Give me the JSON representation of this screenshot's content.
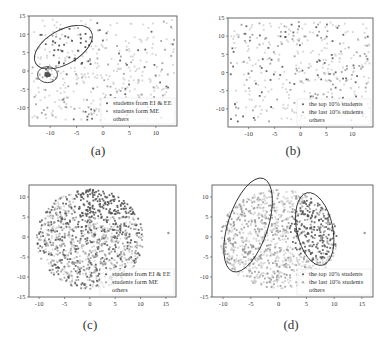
{
  "figure": {
    "panels": [
      {
        "id": "a",
        "caption": "(a)"
      },
      {
        "id": "b",
        "caption": "(b)"
      },
      {
        "id": "c",
        "caption": "(c)"
      },
      {
        "id": "d",
        "caption": "(d)"
      }
    ]
  },
  "chart_data": [
    {
      "panel": "(a)",
      "type": "scatter",
      "title": "",
      "xlabel": "",
      "ylabel": "",
      "xlim": [
        -14,
        14
      ],
      "ylim": [
        -15,
        15
      ],
      "xticks": [
        -10,
        -5,
        0,
        5,
        10
      ],
      "yticks": [
        -10,
        -5,
        0,
        5,
        10,
        15
      ],
      "grid": false,
      "legend_position": "lower right",
      "series": [
        {
          "name": "students from EI & EE",
          "color": "#555555",
          "marker": "dot",
          "note": "sparse dark points concentrated upper-left"
        },
        {
          "name": "students form ME",
          "color": "#9a9a9a",
          "marker": "dot",
          "note": "dense cluster near (-10, -1)"
        },
        {
          "name": "others",
          "color": "#d0d0d0",
          "marker": "dot",
          "note": "spread across whole plane"
        }
      ],
      "annotations": [
        {
          "type": "ellipse",
          "center": [
            -7.5,
            6.5
          ],
          "note": "encircles EI & EE points"
        },
        {
          "type": "ellipse",
          "center": [
            -10.5,
            -1
          ],
          "note": "encircles ME cluster"
        }
      ]
    },
    {
      "panel": "(b)",
      "type": "scatter",
      "title": "",
      "xlabel": "",
      "ylabel": "",
      "xlim": [
        -14,
        14
      ],
      "ylim": [
        -15,
        15
      ],
      "xticks": [
        -10,
        -5,
        0,
        5,
        10
      ],
      "yticks": [
        -10,
        -5,
        0,
        5,
        10,
        15
      ],
      "grid": false,
      "legend_position": "lower right",
      "series": [
        {
          "name": "the top 10% students",
          "color": "#555555",
          "marker": "dot"
        },
        {
          "name": "the last 10% students",
          "color": "#9a9a9a",
          "marker": "dot"
        },
        {
          "name": "others",
          "color": "#d0d0d0",
          "marker": "dot"
        }
      ]
    },
    {
      "panel": "(c)",
      "type": "scatter",
      "title": "",
      "xlabel": "",
      "ylabel": "",
      "xlim": [
        -12,
        17
      ],
      "ylim": [
        -15,
        13
      ],
      "xticks": [
        -10,
        -5,
        0,
        5,
        10,
        15
      ],
      "yticks": [
        -15,
        -10,
        -5,
        0,
        5,
        10
      ],
      "grid": false,
      "legend_position": "lower right",
      "series": [
        {
          "name": "students from EI & EE",
          "color": "#555555",
          "marker": "dot"
        },
        {
          "name": "students form ME",
          "color": "#9a9a9a",
          "marker": "dot"
        },
        {
          "name": "others",
          "color": "#d0d0d0",
          "marker": "dot"
        }
      ],
      "annotations": [
        {
          "type": "outlier",
          "point": [
            15.5,
            1
          ]
        }
      ]
    },
    {
      "panel": "(d)",
      "type": "scatter",
      "title": "",
      "xlabel": "",
      "ylabel": "",
      "xlim": [
        -12,
        17
      ],
      "ylim": [
        -15,
        13
      ],
      "xticks": [
        -10,
        -5,
        0,
        5,
        10,
        15
      ],
      "yticks": [
        -15,
        -10,
        -5,
        0,
        5,
        10
      ],
      "grid": false,
      "legend_position": "lower right",
      "series": [
        {
          "name": "the top 10% students",
          "color": "#555555",
          "marker": "dot"
        },
        {
          "name": "the last 10% students",
          "color": "#9a9a9a",
          "marker": "dot"
        },
        {
          "name": "others",
          "color": "#d0d0d0",
          "marker": "dot"
        }
      ],
      "annotations": [
        {
          "type": "ellipse",
          "center": [
            -5.5,
            3
          ],
          "note": "left region"
        },
        {
          "type": "ellipse",
          "center": [
            6.5,
            2
          ],
          "note": "right region"
        },
        {
          "type": "outlier",
          "point": [
            15.5,
            1
          ]
        }
      ]
    }
  ]
}
